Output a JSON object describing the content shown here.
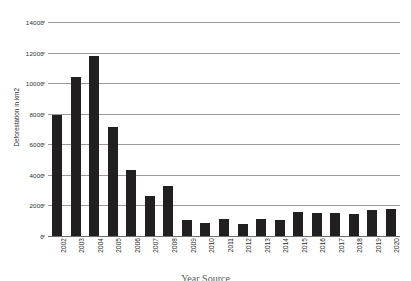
{
  "chart_data": {
    "type": "bar",
    "title": "",
    "xlabel": "Year Source",
    "ylabel": "Deforestation in km2",
    "categories": [
      "2002",
      "2003",
      "2004",
      "2005",
      "2006",
      "2007",
      "2008",
      "2009",
      "2010",
      "2011",
      "2012",
      "2013",
      "2014",
      "2015",
      "2016",
      "2017",
      "2018",
      "2019",
      "2020"
    ],
    "values": [
      7900,
      10400,
      11800,
      7150,
      4320,
      2650,
      3250,
      1030,
      860,
      1120,
      760,
      1140,
      1080,
      1580,
      1490,
      1530,
      1470,
      1670,
      1740
    ],
    "series": [
      {
        "name": "Deforestation",
        "values": [
          7900,
          10400,
          11800,
          7150,
          4320,
          2650,
          3250,
          1030,
          860,
          1120,
          760,
          1140,
          1080,
          1580,
          1490,
          1530,
          1470,
          1670,
          1740
        ]
      }
    ],
    "ylim": [
      0,
      14000
    ],
    "y_ticks": [
      0,
      2000,
      4000,
      6000,
      8000,
      10000,
      12000,
      14000
    ],
    "y_tick_labels": [
      "0",
      "2000",
      "4000",
      "6000",
      "8000",
      "10000",
      "12000",
      "14000"
    ],
    "grid": true,
    "legend": false,
    "legend_position": "none",
    "bar_color": "#211f1f",
    "gridline_color": "#9a9a9a",
    "background_color": "#ffffff"
  }
}
